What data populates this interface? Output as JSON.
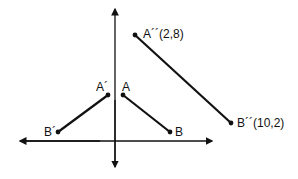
{
  "diagram": {
    "type": "coordinate-plane-transformation",
    "axes": {
      "x_axis": {
        "y": 141,
        "x_start": 20,
        "x_end": 212,
        "arrows": "both"
      },
      "y_axis": {
        "x": 115,
        "y_start": 8,
        "y_end": 167,
        "arrows": "both"
      }
    },
    "segments": [
      {
        "name": "AB",
        "from": "A",
        "to": "B"
      },
      {
        "name": "A'B'",
        "from": "A'",
        "to": "B'"
      },
      {
        "name": "A''B''",
        "from": "A''",
        "to": "B''"
      }
    ],
    "points": {
      "A": {
        "label": "A",
        "px": [
          123,
          95
        ]
      },
      "B": {
        "label": "B",
        "px": [
          170,
          132
        ]
      },
      "A'": {
        "label": "A´",
        "px": [
          108,
          95
        ]
      },
      "B'": {
        "label": "B´",
        "px": [
          58,
          132
        ]
      },
      "A''": {
        "label": "A´´(2,8)",
        "px": [
          135,
          35
        ],
        "coords": [
          2,
          8
        ]
      },
      "B''": {
        "label": "B´´(10,2)",
        "px": [
          231,
          123
        ],
        "coords": [
          10,
          2
        ]
      }
    },
    "labels": {
      "A": "A",
      "B": "B",
      "A_prime": "A´",
      "B_prime": "B´",
      "A_double_prime": "A´´(2,8)",
      "B_double_prime": "B´´(10,2)"
    },
    "colors": {
      "line": "#111111",
      "background": "#ffffff"
    }
  }
}
